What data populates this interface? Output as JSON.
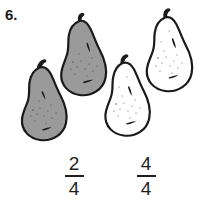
{
  "exercise": {
    "number_label": "6."
  },
  "colors": {
    "shaded_fill": "#9a9a9a",
    "unshaded_fill": "#ffffff",
    "outline": "#1a1a1a",
    "text": "#1f1f1f",
    "background": "#ffffff"
  },
  "pears": [
    {
      "id": "pear-1",
      "shaded": true,
      "fill": "#9a9a9a",
      "label": "shaded-pear"
    },
    {
      "id": "pear-2",
      "shaded": true,
      "fill": "#9a9a9a",
      "label": "shaded-pear"
    },
    {
      "id": "pear-3",
      "shaded": false,
      "fill": "#ffffff",
      "label": "unshaded-pear"
    },
    {
      "id": "pear-4",
      "shaded": false,
      "fill": "#ffffff",
      "label": "unshaded-pear"
    }
  ],
  "fractions": [
    {
      "id": "fraction-left",
      "numerator": "2",
      "denominator": "4"
    },
    {
      "id": "fraction-right",
      "numerator": "4",
      "denominator": "4"
    }
  ]
}
